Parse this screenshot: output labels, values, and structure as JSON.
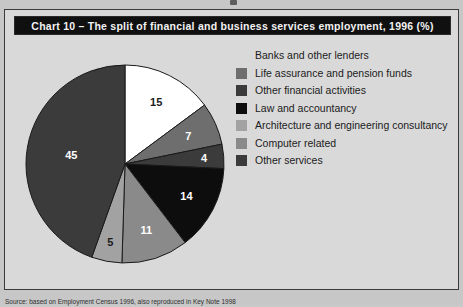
{
  "page": {
    "background_color": "#c7c7c7",
    "scan_artifact": "scan-mark"
  },
  "frame": {
    "background_color": "#d9d9d9",
    "border_color": "#3a3a3a"
  },
  "title": {
    "text": "Chart 10 – The split of financial and business services employment, 1996 (%)",
    "background_color": "#101010",
    "text_color": "#f2f2f2"
  },
  "caption": {
    "text": "Source: based on Employment Census 1996, also reproduced in Key Note 1998"
  },
  "legend": {
    "items": [
      {
        "label": "Banks and other lenders",
        "color": "#ffffff",
        "swatch_visible": false
      },
      {
        "label": "Life assurance and pension funds",
        "color": "#6e6e6e",
        "swatch_visible": true
      },
      {
        "label": "Other financial activities",
        "color": "#3b3b3b",
        "swatch_visible": true
      },
      {
        "label": "Law and accountancy",
        "color": "#0d0d0d",
        "swatch_visible": true
      },
      {
        "label": "Architecture and engineering consultancy",
        "color": "#a2a2a2",
        "swatch_visible": true
      },
      {
        "label": "Computer related",
        "color": "#8a8a8a",
        "swatch_visible": true
      },
      {
        "label": "Other services",
        "color": "#3b3b3b",
        "swatch_visible": true
      }
    ]
  },
  "chart_data": {
    "type": "pie",
    "title": "Chart 10 – The split of financial and business services employment, 1996 (%)",
    "xlabel": "",
    "ylabel": "",
    "units": "%",
    "grid": false,
    "legend_position": "right",
    "start_angle_deg": 0,
    "direction": "clockwise",
    "categories": [
      "Banks and other lenders",
      "Life assurance and pension funds",
      "Other financial activities",
      "Law and accountancy",
      "Architecture and engineering consultancy",
      "Computer related",
      "Other services"
    ],
    "values": [
      15,
      7,
      4,
      14,
      11,
      5,
      45
    ],
    "labels": [
      "15",
      "7",
      "4",
      "14",
      "11",
      "5",
      "45"
    ],
    "colors": [
      "#ffffff",
      "#6e6e6e",
      "#3b3b3b",
      "#0d0d0d",
      "#8a8a8a",
      "#a2a2a2",
      "#3b3b3b"
    ],
    "label_colors": [
      "#1b1b1b",
      "#ffffff",
      "#ffffff",
      "#ffffff",
      "#ffffff",
      "#1b1b1b",
      "#ffffff"
    ],
    "total": 101,
    "outline_color": "#1a1a1a"
  }
}
